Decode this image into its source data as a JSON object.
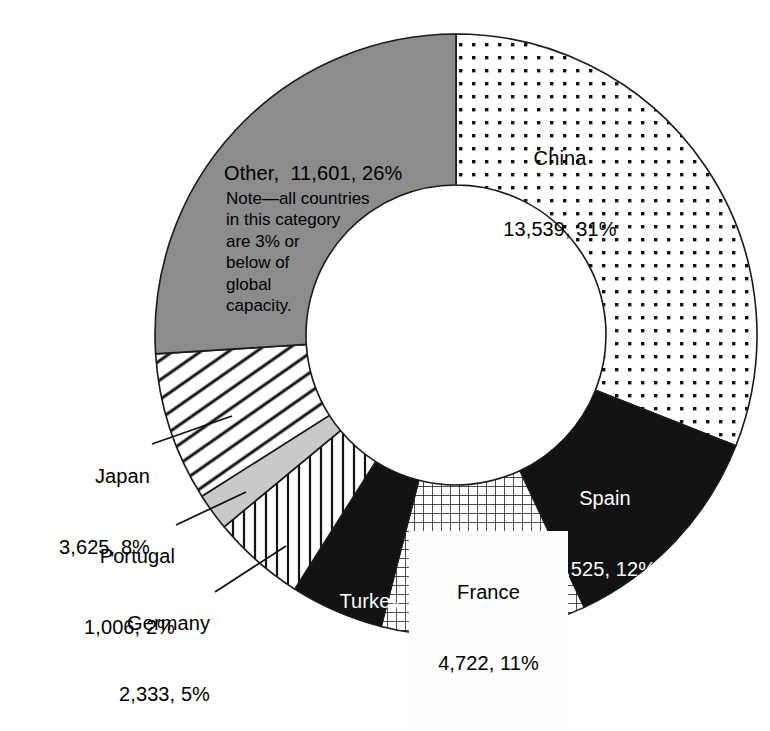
{
  "chart_data": {
    "type": "pie",
    "title": "",
    "subtitle": "",
    "xlabel": "",
    "ylabel": "",
    "legend_position": "in-slice",
    "grid": false,
    "donut": true,
    "start_angle_deg": 0,
    "direction": "clockwise",
    "categories": [
      "China",
      "Spain",
      "France",
      "Turkey",
      "Germany",
      "Portugal",
      "Japan",
      "Other"
    ],
    "values": [
      13539,
      5525,
      4722,
      2424,
      2333,
      1006,
      3625,
      11601
    ],
    "percents": [
      31,
      12,
      11,
      5,
      5,
      2,
      8,
      26
    ],
    "value_labels": [
      "13,539",
      "5,525",
      "4,722",
      "2,424",
      "2,333",
      "1,006",
      "3,625",
      "11,601"
    ],
    "percent_labels": [
      "31%",
      "12%",
      "11%",
      "5%",
      "5%",
      "2%",
      "8%",
      "26%"
    ],
    "annotations": [
      "Note—all countries in this category are 3% or below of global capacity."
    ]
  },
  "slices": [
    {
      "name": "China",
      "line1": "China",
      "line2": "13,539, 31%",
      "percent": 31,
      "value_label": "13,539",
      "percent_label": "31%",
      "fill": "dots",
      "text_color": "#000000"
    },
    {
      "name": "Spain",
      "line1": "Spain",
      "line2": "5,525, 12%",
      "percent": 12,
      "value_label": "5,525",
      "percent_label": "12%",
      "fill": "black",
      "text_color": "#ffffff"
    },
    {
      "name": "France",
      "line1": "France",
      "line2": "4,722, 11%",
      "percent": 11,
      "value_label": "4,722",
      "percent_label": "11%",
      "fill": "grid",
      "text_color": "#000000"
    },
    {
      "name": "Turkey",
      "line1": "Turkey",
      "line2": "2,424, 5%",
      "percent": 5,
      "value_label": "2,424",
      "percent_label": "5%",
      "fill": "black",
      "text_color": "#ffffff"
    },
    {
      "name": "Germany",
      "line1": "Germany",
      "line2": "2,333, 5%",
      "percent": 5,
      "value_label": "2,333",
      "percent_label": "5%",
      "fill": "vertical-lines",
      "text_color": "#000000"
    },
    {
      "name": "Portugal",
      "line1": "Portugal",
      "line2": "1,006, 2%",
      "percent": 2,
      "value_label": "1,006",
      "percent_label": "2%",
      "fill": "light-gray",
      "text_color": "#000000"
    },
    {
      "name": "Japan",
      "line1": "Japan",
      "line2": "3,625, 8%",
      "percent": 8,
      "value_label": "3,625",
      "percent_label": "8%",
      "fill": "diagonal-hatch",
      "text_color": "#000000"
    },
    {
      "name": "Other",
      "line1": "Other,  11,601, 26%",
      "line2": "",
      "percent": 26,
      "value_label": "11,601",
      "percent_label": "26%",
      "fill": "gray",
      "text_color": "#000000"
    }
  ],
  "note": {
    "text": "Note—all countries\nin this category\nare 3% or\nbelow of\nglobal\ncapacity."
  },
  "colors": {
    "gray_slice": "#8c8c8c",
    "light_gray_slice": "#c9c9c9",
    "black_slice": "#121212",
    "outline": "#1a1a1a",
    "background": "#ffffff"
  }
}
